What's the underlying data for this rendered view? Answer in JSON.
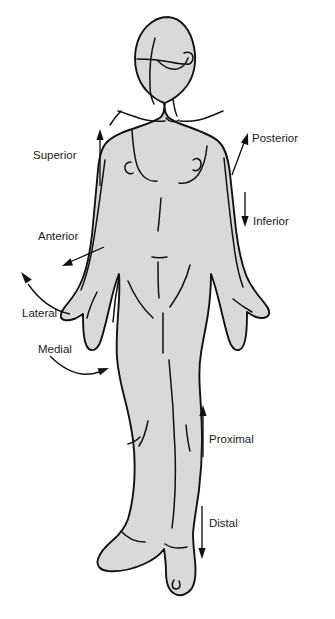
{
  "figure": {
    "background_color": "#ffffff",
    "body_fill_color": "#d9d9d9",
    "outline_color": "#111111",
    "label_color": "#1a1a1a"
  },
  "labels": [
    {
      "id": "superior",
      "text": "Superior",
      "text_x": 33,
      "text_y": 156,
      "anchor": "start",
      "marker": "straight-arrow-up",
      "arrow_from": [
        100,
        186
      ],
      "arrow_to": [
        100,
        130
      ]
    },
    {
      "id": "posterior",
      "text": "Posterior",
      "text_x": 252,
      "text_y": 139,
      "anchor": "start",
      "marker": "diagonal-arrow-up-left",
      "arrow_from": [
        243,
        174
      ],
      "arrow_to": [
        247,
        136
      ]
    },
    {
      "id": "inferior",
      "text": "Inferior",
      "text_x": 253,
      "text_y": 222,
      "anchor": "start",
      "marker": "straight-arrow-down",
      "arrow_from": [
        245,
        192
      ],
      "arrow_to": [
        245,
        226
      ]
    },
    {
      "id": "anterior",
      "text": "Anterior",
      "text_x": 38,
      "text_y": 237,
      "anchor": "start",
      "marker": "diagonal-arrow-down-left",
      "arrow_from": [
        103,
        248
      ],
      "arrow_to": [
        62,
        266
      ]
    },
    {
      "id": "lateral",
      "text": "Lateral",
      "text_x": 22,
      "text_y": 314,
      "anchor": "start",
      "marker": "curved-arrow-up-left",
      "arrow_from": [
        68,
        314
      ],
      "arrow_to": [
        21,
        272
      ]
    },
    {
      "id": "medial",
      "text": "Medial",
      "text_x": 38,
      "text_y": 350,
      "anchor": "start",
      "marker": "curved-arrow-right",
      "arrow_from": [
        50,
        356
      ],
      "arrow_to": [
        107,
        371
      ]
    },
    {
      "id": "proximal",
      "text": "Proximal",
      "text_x": 209,
      "text_y": 440,
      "anchor": "start",
      "marker": "straight-arrow-up",
      "arrow_from": [
        203,
        457
      ],
      "arrow_to": [
        203,
        406
      ]
    },
    {
      "id": "distal",
      "text": "Distal",
      "text_x": 209,
      "text_y": 524,
      "anchor": "start",
      "marker": "straight-arrow-down",
      "arrow_from": [
        202,
        506
      ],
      "arrow_to": [
        202,
        558
      ]
    }
  ],
  "icon_names": {
    "superior": "arrow-up-icon",
    "posterior": "arrow-diagonal-up-left-icon",
    "inferior": "arrow-down-icon",
    "anterior": "arrow-diagonal-down-left-icon",
    "lateral": "curved-arrow-up-left-icon",
    "medial": "curved-arrow-right-icon",
    "proximal": "arrow-up-icon",
    "distal": "arrow-down-icon"
  }
}
